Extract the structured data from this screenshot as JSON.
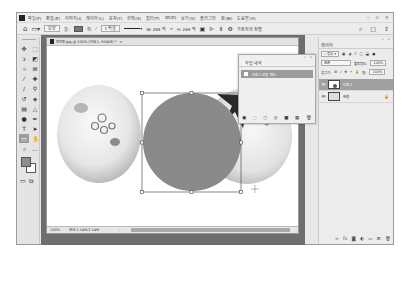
{
  "menubar": {
    "items": [
      "파일(F)",
      "편집(E)",
      "이미지(I)",
      "레이어(L)",
      "문자(Y)",
      "선택(S)",
      "필터(T)",
      "3D(D)",
      "보기(V)",
      "플러그인",
      "창(W)",
      "도움말(H)"
    ],
    "window_controls": [
      "–",
      "▫",
      "×"
    ]
  },
  "options_bar": {
    "shape_mode": "모양",
    "stroke_width": "1 픽셀",
    "w_value": "W: 269 픽",
    "h_value": "H: 269 픽",
    "align_edges": "가장자리 정렬",
    "right_icons": [
      "search-icon",
      "frame-icon",
      "share-icon"
    ]
  },
  "document": {
    "tab_title": "토마토.jpg @ 100% (타원 1, RGB/8) *",
    "close_glyph": "×",
    "zoom": "100%",
    "doc_info": "문서:1.14M/1.14M",
    "arrow": "›"
  },
  "history_panel": {
    "tab": "작업 내역",
    "item": "타원 1 모양 패스",
    "footer_icons": [
      "●",
      "◌",
      "○",
      "◎",
      "■",
      "▦",
      "🗑"
    ]
  },
  "layers_panel": {
    "tab": "레이어",
    "filter_label": "종류",
    "blend_mode": "표준",
    "opacity_label": "불투명도:",
    "opacity_value": "100%",
    "lock_label": "잠그기:",
    "fill_label": "칠:",
    "fill_value": "100%",
    "layers": [
      {
        "name": "타원 1",
        "selected": true
      },
      {
        "name": "배경",
        "selected": false
      }
    ],
    "footer_icons": [
      "link",
      "fx",
      "mask",
      "adjust",
      "folder",
      "new",
      "trash"
    ]
  },
  "colors": {
    "foreground": "#8e8e8e",
    "background": "#ffffff",
    "shape_fill": "#8a8a8a"
  }
}
